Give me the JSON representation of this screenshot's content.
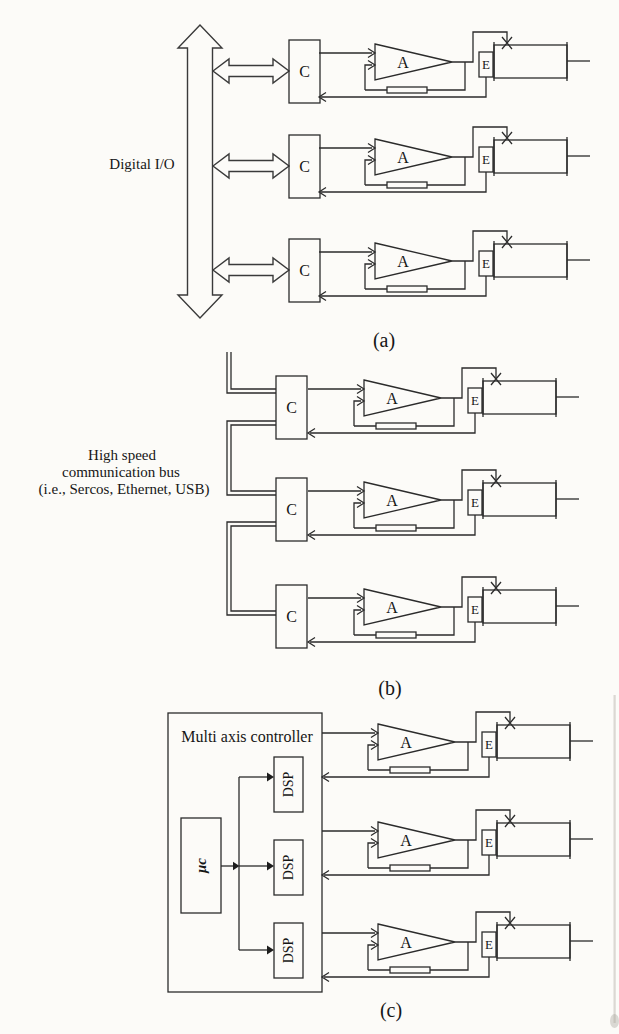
{
  "blocks": {
    "controller": "C",
    "amplifier": "A",
    "encoder": "E",
    "motor": "M"
  },
  "panel_a": {
    "bus_label": "Digital I/O",
    "caption": "(a)"
  },
  "panel_b": {
    "bus_label_lines": [
      "High speed",
      "communication bus",
      "(i.e., Sercos, Ethernet, USB)"
    ],
    "caption": "(b)"
  },
  "panel_c": {
    "title": "Multi axis controller",
    "micro_label": "μc",
    "dsp_label": "DSP",
    "caption": "(c)"
  },
  "colors": {
    "line": "#2b2b2b",
    "background": "#fcfbf8"
  }
}
